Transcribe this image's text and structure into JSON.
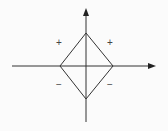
{
  "diagram": {
    "colors": {
      "background": "#fbfbfb",
      "stroke": "#333333",
      "label": "#444444"
    },
    "axes": {
      "horizontal": {
        "x1": 12,
        "y": 66,
        "x2": 155,
        "arrow": "right"
      },
      "vertical": {
        "x": 86,
        "y1": 122,
        "y2": 8,
        "arrow": "up"
      }
    },
    "diamond": {
      "vertices": {
        "top": [
          86,
          33
        ],
        "right": [
          113,
          66
        ],
        "bottom": [
          86,
          99
        ],
        "left": [
          60,
          66
        ]
      }
    },
    "labels": {
      "upper_left": "+",
      "upper_right": "+",
      "lower_left": "−",
      "lower_right": "−"
    }
  }
}
